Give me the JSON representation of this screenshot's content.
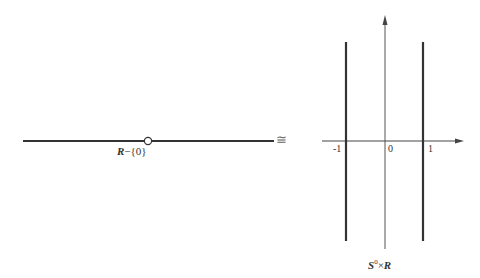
{
  "left_figure": {
    "label_set": "R",
    "label_rest": "−{0}",
    "description": "real line with point 0 removed (open circle)"
  },
  "relation_symbol": "≅",
  "right_figure": {
    "x_ticks": [
      "-1",
      "0",
      "1"
    ],
    "label_S": "S",
    "label_sup": "0",
    "label_times": "×",
    "label_R": "R",
    "description": "two vertical lines at x=-1 and x=1"
  }
}
